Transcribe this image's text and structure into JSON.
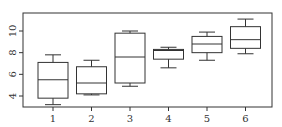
{
  "chart_data": {
    "type": "box",
    "title": "",
    "xlabel": "",
    "ylabel": "",
    "categories": [
      "1",
      "2",
      "3",
      "4",
      "5",
      "6"
    ],
    "yticks": [
      "4",
      "6",
      "8",
      "10"
    ],
    "ylim": [
      2.9,
      11.7
    ],
    "grid": false,
    "legend": null,
    "boxes": [
      {
        "label": "1",
        "min": 3.2,
        "q1": 3.8,
        "median": 5.5,
        "q3": 7.1,
        "max": 7.8
      },
      {
        "label": "2",
        "min": 4.1,
        "q1": 4.2,
        "median": 5.2,
        "q3": 6.7,
        "max": 7.3
      },
      {
        "label": "3",
        "min": 4.9,
        "q1": 5.2,
        "median": 7.6,
        "q3": 9.8,
        "max": 10.0
      },
      {
        "label": "4",
        "min": 6.6,
        "q1": 7.4,
        "median": 8.2,
        "q3": 8.3,
        "max": 8.5
      },
      {
        "label": "5",
        "min": 7.3,
        "q1": 8.0,
        "median": 8.8,
        "q3": 9.5,
        "max": 9.9
      },
      {
        "label": "6",
        "min": 7.9,
        "q1": 8.4,
        "median": 9.2,
        "q3": 10.4,
        "max": 11.1
      }
    ]
  },
  "colors": {
    "stroke": "#333333",
    "background": "#ffffff"
  }
}
